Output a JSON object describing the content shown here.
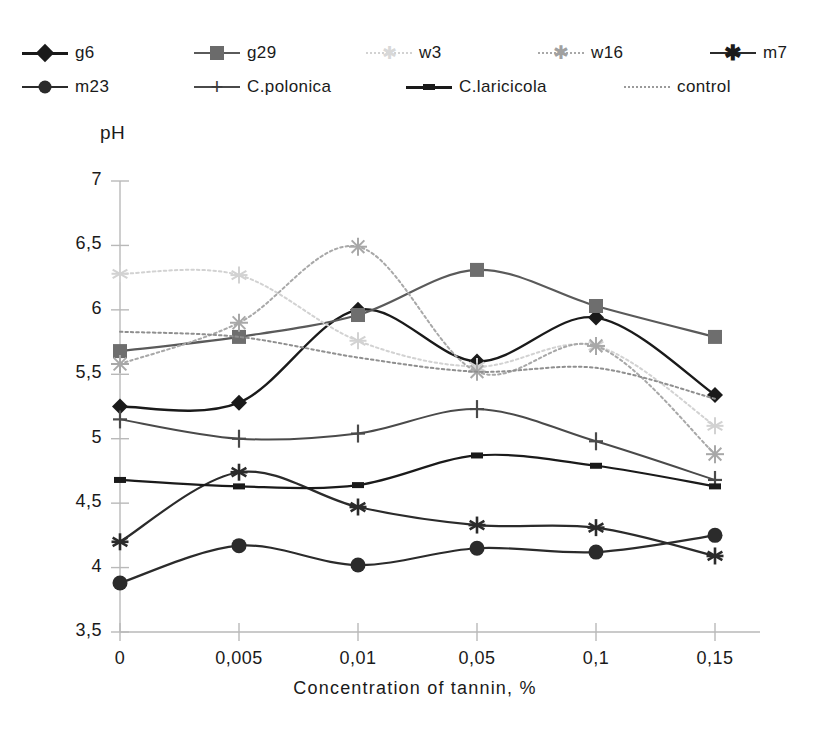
{
  "chart_data": {
    "type": "line",
    "title": "",
    "xlabel": "Concentration of tannin, %",
    "ylabel": "pH",
    "categories": [
      "0",
      "0,005",
      "0,01",
      "0,05",
      "0,1",
      "0,15"
    ],
    "ylim": [
      3.5,
      7.0
    ],
    "ytick_labels": [
      "7",
      "6,5",
      "6",
      "5,5",
      "5",
      "4,5",
      "4",
      "3,5"
    ],
    "ytick_values": [
      7,
      6.5,
      6,
      5.5,
      5,
      4.5,
      4,
      3.5
    ],
    "grid": false,
    "legend_position": "top",
    "series": [
      {
        "name": "g6",
        "marker": "diamond",
        "color": "#1a1a1a",
        "width": 2.4,
        "dash": "none",
        "values": [
          5.25,
          5.28,
          6.0,
          5.6,
          5.94,
          5.34
        ]
      },
      {
        "name": "g29",
        "marker": "square",
        "color": "#5a5a5a",
        "width": 2.2,
        "dash": "none",
        "values": [
          5.68,
          5.79,
          5.96,
          6.31,
          6.03,
          5.79
        ]
      },
      {
        "name": "w3",
        "marker": "star",
        "color": "#d2d2d2",
        "width": 2.0,
        "dash": "dotted",
        "values": [
          6.28,
          6.27,
          5.76,
          5.56,
          5.72,
          5.1
        ]
      },
      {
        "name": "w16",
        "marker": "cross-x",
        "color": "#a8a8a8",
        "width": 2.0,
        "dash": "dotted",
        "values": [
          5.58,
          5.9,
          6.49,
          5.52,
          5.72,
          4.88
        ]
      },
      {
        "name": "m7",
        "marker": "asterisk",
        "color": "#2b2b2b",
        "width": 2.2,
        "dash": "none",
        "values": [
          4.2,
          4.74,
          4.47,
          4.33,
          4.31,
          4.09
        ]
      },
      {
        "name": "m23",
        "marker": "circle",
        "color": "#2b2b2b",
        "width": 2.2,
        "dash": "none",
        "values": [
          3.88,
          4.17,
          4.02,
          4.15,
          4.12,
          4.25
        ]
      },
      {
        "name": "C.polonica",
        "marker": "plus",
        "color": "#4a4a4a",
        "width": 2.0,
        "dash": "none",
        "values": [
          5.15,
          5.0,
          5.04,
          5.23,
          4.98,
          4.68
        ]
      },
      {
        "name": "C.laricicola",
        "marker": "dash",
        "color": "#1a1a1a",
        "width": 2.2,
        "dash": "none",
        "values": [
          4.68,
          4.63,
          4.64,
          4.87,
          4.79,
          4.63
        ]
      },
      {
        "name": "control",
        "marker": "none",
        "color": "#8f8f8f",
        "width": 2.0,
        "dash": "dotted",
        "values": [
          5.83,
          5.79,
          5.63,
          5.52,
          5.55,
          5.31
        ]
      }
    ]
  },
  "legend": {
    "rows": [
      [
        {
          "label": "g6"
        },
        {
          "label": "g29"
        },
        {
          "label": "w3"
        },
        {
          "label": "w16"
        },
        {
          "label": "m7"
        }
      ],
      [
        {
          "label": "m23"
        },
        {
          "label": "C.polonica"
        },
        {
          "label": "C.laricicola"
        },
        {
          "label": "control"
        }
      ]
    ]
  }
}
